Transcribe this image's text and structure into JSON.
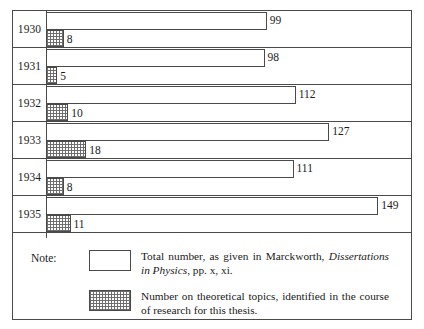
{
  "chart_data": {
    "type": "bar",
    "title": "",
    "xlabel": "",
    "ylabel": "",
    "orientation": "horizontal",
    "categories": [
      "1930",
      "1931",
      "1932",
      "1933",
      "1934",
      "1935"
    ],
    "series": [
      {
        "name": "Total number, as given in Marckworth, Dissertations in Physics, pp. x, xi.",
        "values": [
          99,
          98,
          112,
          127,
          111,
          149
        ]
      },
      {
        "name": "Number on theoretical topics, identified in the course of research for this thesis.",
        "values": [
          8,
          5,
          10,
          18,
          8,
          11
        ]
      }
    ],
    "xlim": [
      0,
      160
    ],
    "grid": false,
    "legend_position": "bottom"
  },
  "chart": {
    "rows": [
      {
        "year": "1930",
        "total": 99,
        "total_label": "99",
        "theory": 8,
        "theory_label": "8"
      },
      {
        "year": "1931",
        "total": 98,
        "total_label": "98",
        "theory": 5,
        "theory_label": "5"
      },
      {
        "year": "1932",
        "total": 112,
        "total_label": "112",
        "theory": 10,
        "theory_label": "10"
      },
      {
        "year": "1933",
        "total": 127,
        "total_label": "127",
        "theory": 18,
        "theory_label": "18"
      },
      {
        "year": "1934",
        "total": 111,
        "total_label": "111",
        "theory": 8,
        "theory_label": "8"
      },
      {
        "year": "1935",
        "total": 149,
        "total_label": "149",
        "theory": 11,
        "theory_label": "11"
      }
    ]
  },
  "note": {
    "label": "Note:",
    "entries": [
      {
        "swatch": "plain-swatch",
        "text_before": "Total number, as given in Marckworth, ",
        "text_italic": "Dissertations in Physics",
        "text_after": ", pp. x, xi."
      },
      {
        "swatch": "hatched-swatch",
        "text_before": "Number on theoretical topics, identified in the course of research for this thesis.",
        "text_italic": "",
        "text_after": ""
      }
    ]
  },
  "style": {
    "line_color": "#4a4a4a",
    "hatch_color": "#6e6e6e",
    "background": "#ffffff"
  }
}
